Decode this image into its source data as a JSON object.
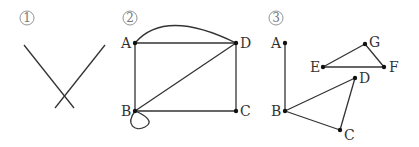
{
  "panels": [
    {
      "id": "1",
      "marker": "1",
      "description": "Two crossing line segments, no vertices",
      "segments": [
        {
          "from": [
            24,
            45
          ],
          "to": [
            74,
            108
          ]
        },
        {
          "from": [
            105,
            45
          ],
          "to": [
            55,
            108
          ]
        }
      ]
    },
    {
      "id": "2",
      "marker": "2",
      "labels": {
        "A": "A",
        "B": "B",
        "C": "C",
        "D": "D"
      },
      "vertices": [
        "A",
        "B",
        "C",
        "D"
      ],
      "edges": [
        [
          "A",
          "D"
        ],
        [
          "A",
          "D",
          "curved"
        ],
        [
          "A",
          "B"
        ],
        [
          "B",
          "C"
        ],
        [
          "C",
          "D"
        ],
        [
          "B",
          "D"
        ],
        [
          "B",
          "B",
          "loop"
        ]
      ]
    },
    {
      "id": "3",
      "marker": "3",
      "labels": {
        "A": "A",
        "B": "B",
        "C": "C",
        "D": "D",
        "E": "E",
        "F": "F",
        "G": "G"
      },
      "vertices": [
        "A",
        "B",
        "C",
        "D",
        "E",
        "F",
        "G"
      ],
      "edges": [
        [
          "A",
          "B"
        ],
        [
          "B",
          "D"
        ],
        [
          "B",
          "C"
        ],
        [
          "C",
          "D"
        ],
        [
          "E",
          "F"
        ],
        [
          "E",
          "G"
        ],
        [
          "G",
          "F"
        ]
      ]
    }
  ]
}
